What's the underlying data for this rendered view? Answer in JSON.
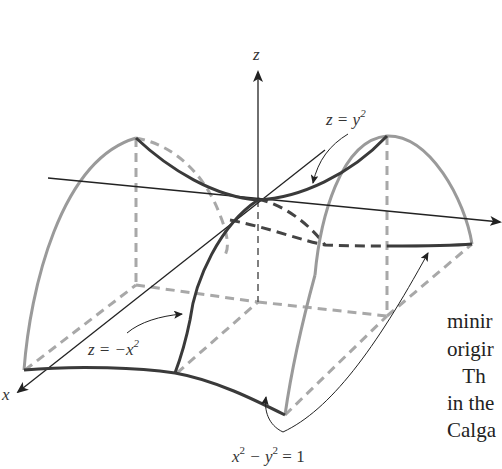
{
  "figure": {
    "axes": {
      "z_label": "z",
      "x_label": "x"
    },
    "labels": {
      "z_eq_y2": {
        "lhs": "z = y",
        "exp": "2"
      },
      "z_eq_neg_x2": {
        "lhs": "z = −x",
        "exp": "2"
      },
      "hyperbola": {
        "a": "x",
        "a_exp": "2",
        "mid": " − y",
        "b_exp": "2",
        "rhs": " = 1"
      }
    },
    "colors": {
      "light_curve": "#9a9a9a",
      "dark_curve": "#3a3a3a",
      "axis": "#222222",
      "dashed_light": "#a8a8a8",
      "dashed_dark": "#444444"
    }
  },
  "side_text": {
    "lines": [
      "minir",
      "origir",
      "   Th",
      "in the",
      "Calga"
    ]
  }
}
